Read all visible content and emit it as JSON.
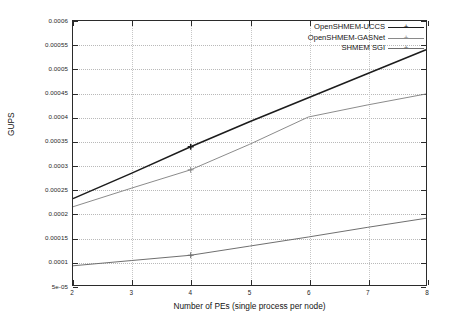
{
  "chart_data": {
    "type": "line",
    "title": "",
    "xlabel": "Number of PEs (single process per node)",
    "ylabel": "GUPS",
    "xlim": [
      2,
      8
    ],
    "ylim": [
      5e-05,
      0.0006
    ],
    "grid": true,
    "legend_position": "top-right",
    "x": [
      2,
      3,
      4,
      5,
      6,
      7,
      8
    ],
    "xticks": [
      "2",
      "3",
      "4",
      "5",
      "6",
      "7",
      "8"
    ],
    "yticks": [
      "0.0006",
      "0.00055",
      "0.0005",
      "0.00045",
      "0.0004",
      "0.00035",
      "0.0003",
      "0.00025",
      "0.0002",
      "0.00015",
      "0.0001",
      "5e-05"
    ],
    "ytick_values": [
      0.0006,
      0.00055,
      0.0005,
      0.00045,
      0.0004,
      0.00035,
      0.0003,
      0.00025,
      0.0002,
      0.00015,
      0.0001,
      5e-05
    ],
    "series": [
      {
        "name": "OpenSHMEM-UCCS",
        "color": "#1c1c1c",
        "width": 1.5,
        "marker": "+",
        "values": [
          0.00023,
          0.000283,
          0.000338,
          0.00039,
          0.00044,
          0.00049,
          0.00054
        ]
      },
      {
        "name": "OpenSHMEM-GASNet",
        "color": "#8a8a8a",
        "width": 1.0,
        "marker": "+",
        "values": [
          0.000213,
          0.000252,
          0.00029,
          0.000343,
          0.0004,
          0.000425,
          0.000448
        ]
      },
      {
        "name": "SHMEM SGI",
        "color": "#6e6e6e",
        "width": 1.0,
        "marker": "+",
        "values": [
          9e-05,
          0.000101,
          0.000112,
          0.000131,
          0.00015,
          0.00017,
          0.000189
        ]
      }
    ]
  },
  "legend": {
    "entries": [
      {
        "label": "OpenSHMEM-UCCS"
      },
      {
        "label": "OpenSHMEM-GASNet"
      },
      {
        "label": "SHMEM SGI"
      }
    ]
  },
  "axes": {
    "x_title": "Number of PEs (single process per node)",
    "y_title": "GUPS"
  }
}
